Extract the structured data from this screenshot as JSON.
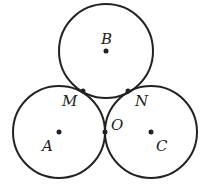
{
  "diagram": {
    "stroke_color": "#222222",
    "circles": [
      {
        "name": "B",
        "cx": 106,
        "cy": 51,
        "r": 47
      },
      {
        "name": "A",
        "cx": 59,
        "cy": 132,
        "r": 46
      },
      {
        "name": "C",
        "cx": 151,
        "cy": 132,
        "r": 46
      }
    ],
    "points": [
      {
        "label": "B",
        "x": 106,
        "y": 51,
        "lx": 101,
        "ly": 44
      },
      {
        "label": "A",
        "x": 59,
        "y": 132,
        "lx": 42,
        "ly": 151
      },
      {
        "label": "C",
        "x": 151,
        "y": 132,
        "lx": 156,
        "ly": 151
      },
      {
        "label": "M",
        "x": 83,
        "y": 91,
        "lx": 62,
        "ly": 106
      },
      {
        "label": "N",
        "x": 128,
        "y": 91,
        "lx": 135,
        "ly": 106
      },
      {
        "label": "O",
        "x": 105,
        "y": 132,
        "lx": 111,
        "ly": 130
      }
    ]
  }
}
